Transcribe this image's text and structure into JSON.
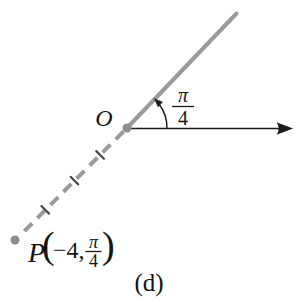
{
  "figure": {
    "caption": "(d)",
    "colors": {
      "ray": "#9a9a9a",
      "dot": "#8e8e8e",
      "axis": "#1a1a1a",
      "text": "#141414",
      "background": "#ffffff"
    },
    "origin": {
      "label": "O"
    },
    "angle": {
      "numerator": "π",
      "denominator": "4",
      "value_label": "π/4"
    },
    "point": {
      "name": "P",
      "open_paren": "(",
      "radius_text": "−4,",
      "angle_numerator": "π",
      "angle_denominator": "4",
      "close_paren": ")",
      "full_label": "P(−4, π/4)"
    }
  }
}
